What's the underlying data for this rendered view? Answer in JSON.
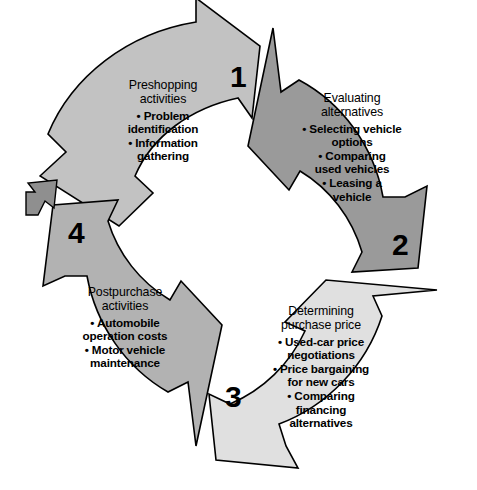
{
  "diagram": {
    "type": "circular-process",
    "background_color": "#ffffff",
    "outline_color": "#000000",
    "continuation_arrow": {
      "name": "cycle-continuation-arrow",
      "direction": "up-left",
      "color": "#8f8f8f"
    },
    "stages": [
      {
        "number": "1",
        "heading_line1": "Preshopping",
        "heading_line2": "activities",
        "fill_color": "#c2c2c2",
        "bullets": [
          "• Problem",
          "identification",
          "• Information",
          "gathering"
        ]
      },
      {
        "number": "2",
        "heading_line1": "Evaluating",
        "heading_line2": "alternatives",
        "fill_color": "#9a9a9a",
        "bullets": [
          "• Selecting vehicle",
          "options",
          "• Comparing",
          "used vehicles",
          "• Leasing a",
          "vehicle"
        ]
      },
      {
        "number": "3",
        "heading_line1": "Determining",
        "heading_line2": "purchase price",
        "fill_color": "#e0e0e0",
        "bullets": [
          "• Used-car price",
          "negotiations",
          "• Price bargaining",
          "for new cars",
          "• Comparing",
          "financing",
          "alternatives"
        ]
      },
      {
        "number": "4",
        "heading_line1": "Postpurchase",
        "heading_line2": "activities",
        "fill_color": "#b2b2b2",
        "bullets": [
          "• Automobile",
          "operation costs",
          "• Motor vehicle",
          "maintenance"
        ]
      }
    ]
  }
}
